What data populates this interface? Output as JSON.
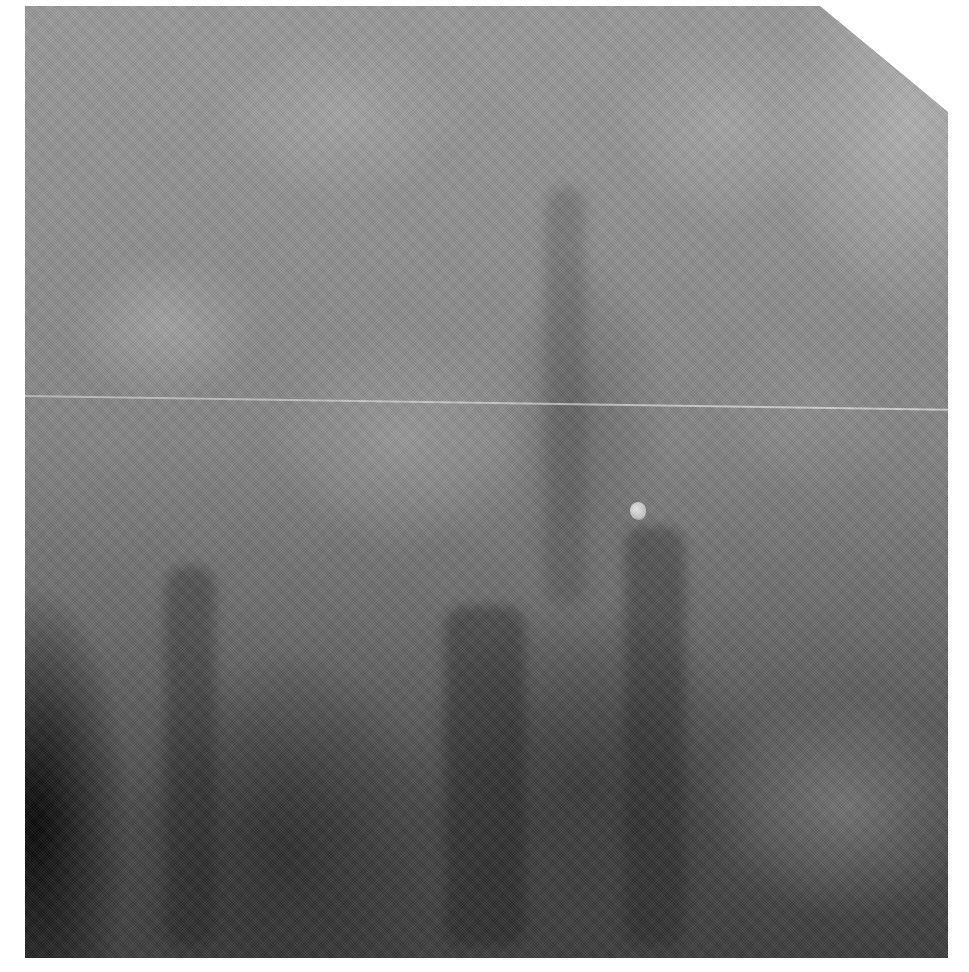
{
  "image": {
    "type": "grayscale mammogram (x-ray)",
    "background_color": "#ffffff",
    "tone_range": {
      "light": "#b4b4b4",
      "mid": "#858585",
      "dark": "#0a0a0a"
    },
    "features": [
      {
        "name": "horizontal artifact line",
        "approx_y": 395
      },
      {
        "name": "small bright focal density",
        "approx_x": 638,
        "approx_y": 510
      },
      {
        "name": "clipped top-right corner"
      }
    ]
  }
}
